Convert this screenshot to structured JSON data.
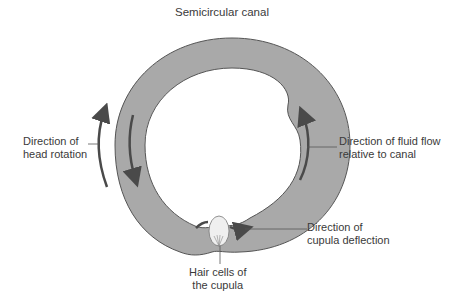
{
  "figure": {
    "corner_mark": "",
    "title": "Semicircular canal",
    "labels": {
      "head_rotation": [
        "Direction of",
        "head rotation"
      ],
      "fluid_flow": [
        "Direction of fluid flow",
        "relative to canal"
      ],
      "cupula_deflection": [
        "Direction of",
        "cupula deflection"
      ],
      "hair_cells": [
        "Hair cells of",
        "the cupula"
      ]
    },
    "colors": {
      "canal_fill": "#a9a9a9",
      "canal_stroke": "#555555",
      "arrow": "#4a4a4a",
      "cupula_fill": "#efefef",
      "background": "#ffffff"
    }
  }
}
